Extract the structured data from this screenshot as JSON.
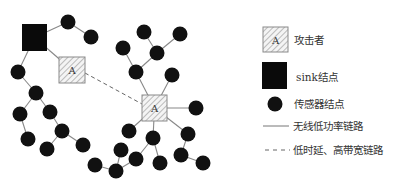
{
  "colors": {
    "node": "#111111",
    "edge": "#888888",
    "dashed_edge": "#666666",
    "sink": "#0a0a0a",
    "attacker_fill": "#f4f4f4",
    "attacker_hatch": "#9a9a9a",
    "attacker_border": "#8a8a8a",
    "text": "#333333"
  },
  "network": {
    "sink": {
      "x": 22,
      "y": 24,
      "w": 25,
      "h": 27
    },
    "attackers": [
      {
        "id": "A1",
        "label": "A",
        "x": 59,
        "y": 57,
        "w": 26,
        "h": 26
      },
      {
        "id": "A2",
        "label": "A",
        "x": 142,
        "y": 95,
        "w": 25,
        "h": 26
      }
    ],
    "sensor_radius": 7.5,
    "sensors": [
      {
        "id": "n1",
        "x": 68,
        "y": 22
      },
      {
        "id": "n2",
        "x": 91,
        "y": 37
      },
      {
        "id": "n3",
        "x": 18,
        "y": 72
      },
      {
        "id": "n4",
        "x": 36,
        "y": 93
      },
      {
        "id": "n5",
        "x": 20,
        "y": 114
      },
      {
        "id": "n6",
        "x": 50,
        "y": 112
      },
      {
        "id": "n7",
        "x": 28,
        "y": 139
      },
      {
        "id": "n8",
        "x": 62,
        "y": 131
      },
      {
        "id": "n9",
        "x": 47,
        "y": 149
      },
      {
        "id": "n10",
        "x": 83,
        "y": 145
      },
      {
        "id": "n11",
        "x": 144,
        "y": 32
      },
      {
        "id": "n12",
        "x": 180,
        "y": 34
      },
      {
        "id": "n13",
        "x": 123,
        "y": 48
      },
      {
        "id": "n14",
        "x": 157,
        "y": 53
      },
      {
        "id": "n15",
        "x": 136,
        "y": 72
      },
      {
        "id": "n16",
        "x": 172,
        "y": 75
      },
      {
        "id": "n17",
        "x": 196,
        "y": 108
      },
      {
        "id": "n18",
        "x": 129,
        "y": 131
      },
      {
        "id": "n19",
        "x": 153,
        "y": 138
      },
      {
        "id": "n20",
        "x": 136,
        "y": 159
      },
      {
        "id": "n21",
        "x": 160,
        "y": 163
      },
      {
        "id": "n22",
        "x": 116,
        "y": 171
      },
      {
        "id": "n23",
        "x": 121,
        "y": 150
      },
      {
        "id": "n24",
        "x": 95,
        "y": 165
      },
      {
        "id": "n25",
        "x": 188,
        "y": 134
      },
      {
        "id": "n26",
        "x": 181,
        "y": 155
      },
      {
        "id": "n27",
        "x": 203,
        "y": 163
      }
    ],
    "edges": [
      [
        "S",
        "n1"
      ],
      [
        "n1",
        "n2"
      ],
      [
        "S",
        "A1"
      ],
      [
        "S",
        "n3"
      ],
      [
        "n3",
        "n4"
      ],
      [
        "n4",
        "n5"
      ],
      [
        "n4",
        "n6"
      ],
      [
        "n5",
        "n7"
      ],
      [
        "n6",
        "n8"
      ],
      [
        "n8",
        "n9"
      ],
      [
        "n8",
        "n10"
      ],
      [
        "n11",
        "n14"
      ],
      [
        "n12",
        "n14"
      ],
      [
        "n14",
        "n15"
      ],
      [
        "n13",
        "n15"
      ],
      [
        "n15",
        "A2"
      ],
      [
        "n16",
        "A2"
      ],
      [
        "A2",
        "n17"
      ],
      [
        "A2",
        "n18"
      ],
      [
        "A2",
        "n19"
      ],
      [
        "n19",
        "n20"
      ],
      [
        "n19",
        "n21"
      ],
      [
        "n20",
        "n22"
      ],
      [
        "n22",
        "n23"
      ],
      [
        "n22",
        "n24"
      ],
      [
        "A2",
        "n25"
      ],
      [
        "n25",
        "n26"
      ],
      [
        "n26",
        "n27"
      ]
    ],
    "dashed_edges": [
      {
        "from": [
          85,
          73
        ],
        "to": [
          142,
          104
        ]
      }
    ]
  },
  "legend": {
    "items": [
      {
        "key": "attacker",
        "symbol_label": "A",
        "label": "攻击者"
      },
      {
        "key": "sink",
        "label": "sink结点"
      },
      {
        "key": "sensor",
        "label": "传感器结点"
      },
      {
        "key": "solid",
        "label": "无线低功率链路"
      },
      {
        "key": "dashed",
        "label": "低时延、高带宽链路"
      }
    ]
  }
}
